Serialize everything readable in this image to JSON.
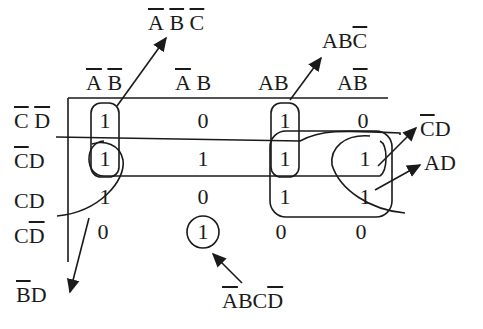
{
  "kmap": {
    "variables": [
      "A",
      "B",
      "C",
      "D"
    ],
    "column_headers": [
      {
        "text": "A B",
        "overline": [
          "A",
          "B"
        ]
      },
      {
        "text": "A B",
        "overline": [
          "A"
        ]
      },
      {
        "text": "AB",
        "overline": []
      },
      {
        "text": "AB",
        "overline": [
          "B"
        ]
      }
    ],
    "row_headers": [
      {
        "text": "C D",
        "overline": [
          "C",
          "D"
        ]
      },
      {
        "text": "CD",
        "overline": [
          "C"
        ]
      },
      {
        "text": "CD",
        "overline": []
      },
      {
        "text": "CD",
        "overline": [
          "D"
        ]
      }
    ],
    "cells": [
      [
        "1",
        "0",
        "1",
        "0"
      ],
      [
        "1",
        "1",
        "1",
        "1"
      ],
      [
        "1",
        "0",
        "1",
        "1"
      ],
      [
        "0",
        "1",
        "0",
        "0"
      ]
    ]
  },
  "groups": [
    {
      "term": "A̅ B̅ C̅",
      "label": "ABC",
      "cells": "col 1, rows 1-2"
    },
    {
      "term": "ABC̅",
      "label": "ABC",
      "cells": "col 3, rows 1-2"
    },
    {
      "term": "C̅D",
      "label": "CD",
      "cells": "row 2"
    },
    {
      "term": "AD",
      "label": "AD",
      "cells": "cols 3-4, rows 2-3"
    },
    {
      "term": "B̅D",
      "label": "BD",
      "cells": "cols 1 & 4, rows 2-3"
    },
    {
      "term": "A̅BCD̅",
      "label": "ABCD",
      "cells": "col 2, row 4"
    }
  ],
  "annotations": {
    "abc_bar": {
      "a": "A",
      "b": "B",
      "c": "C"
    },
    "abc_c_bar": {
      "ab": "AB",
      "c": "C"
    },
    "c_bar_d": {
      "c": "C",
      "d": "D"
    },
    "ad": "AD",
    "b_bar_d": {
      "b": "B",
      "d": "D"
    },
    "a_bar_b_c_d_bar": {
      "a": "A",
      "bc": "BC",
      "d": "D"
    }
  }
}
